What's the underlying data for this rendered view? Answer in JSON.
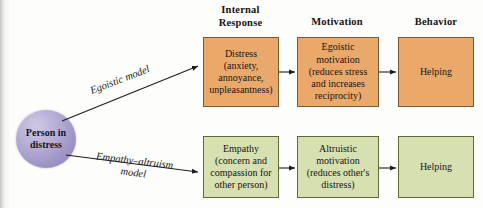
{
  "figure": {
    "type": "flow-diagram",
    "title": "",
    "background_color": "#fdfdfb",
    "colors": {
      "egoistic_path": "#eaa86a",
      "altruism_path": "#d6e0b0",
      "person_node": "#a89ecb",
      "arrow": "#1d1d1d",
      "text": "#161616"
    }
  },
  "headers": [
    {
      "label": "Internal\nResponse",
      "line1": "Internal",
      "line2": "Response"
    },
    {
      "label": "Motivation",
      "line1": "Motivation",
      "line2": ""
    },
    {
      "label": "Behavior",
      "line1": "Behavior",
      "line2": ""
    }
  ],
  "source_node": {
    "line1": "Person",
    "line2": "in",
    "line3": "distress",
    "shape": "circle",
    "color": "#a89ecb"
  },
  "edge_labels": {
    "top": {
      "line1": "Egoistic model",
      "line2": ""
    },
    "bottom": {
      "line1": "Empathy–altruism",
      "line2": "model"
    }
  },
  "rows": [
    {
      "name": "egoistic-model-row",
      "color": "#eaa86a",
      "boxes": [
        {
          "name": "distress-box",
          "lines": [
            "Distress",
            "(anxiety,",
            "annoyance,",
            "unpleasantness)"
          ]
        },
        {
          "name": "egoistic-motivation-box",
          "lines": [
            "Egoistic",
            "motivation",
            "(reduces stress",
            "and increases",
            "reciprocity)"
          ]
        },
        {
          "name": "helping-box-egoistic",
          "lines": [
            "Helping"
          ]
        }
      ]
    },
    {
      "name": "empathy-altruism-model-row",
      "color": "#d6e0b0",
      "boxes": [
        {
          "name": "empathy-box",
          "lines": [
            "Empathy",
            "(concern and",
            "compassion for",
            "other person)"
          ]
        },
        {
          "name": "altruistic-motivation-box",
          "lines": [
            "Altruistic",
            "motivation",
            "(reduces other's",
            "distress)"
          ]
        },
        {
          "name": "helping-box-altruistic",
          "lines": [
            "Helping"
          ]
        }
      ]
    }
  ]
}
